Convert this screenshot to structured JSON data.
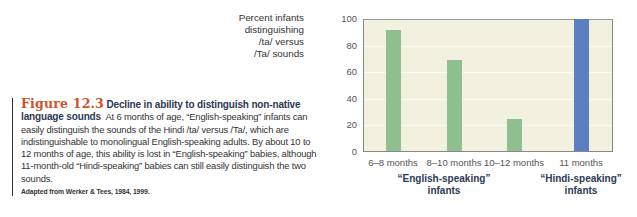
{
  "caption": {
    "figure_number": "Figure 12.3",
    "title": "Decline in ability to distinguish non-native language sounds",
    "body": "At 6 months of age, “English-speaking” infants can easily distinguish the sounds of the Hindi /ta/ versus /Ta/, which are indistinguishable to monolingual English-speaking adults. By about 10 to 12 months of age, this ability is lost in “English-speaking” babies, although 11-month-old “Hindi-speaking” babies can still easily distinguish the two sounds.",
    "source": "Adapted from Werker & Tees, 1984, 1999."
  },
  "chart_data": {
    "type": "bar",
    "title": "",
    "ylabel": "Percent infants distinguishing /ta/ versus /Ta/ sounds",
    "ylabel_lines": [
      "Percent infants",
      "distinguishing",
      "/ta/ versus",
      "/Ta/ sounds"
    ],
    "xlabel": "",
    "ylim": [
      0,
      100
    ],
    "yticks": [
      0,
      20,
      40,
      60,
      80,
      100
    ],
    "grid": true,
    "categories": [
      "6–8 months",
      "8–10 months",
      "10–12 months",
      "11 months"
    ],
    "values": [
      92,
      69,
      24,
      100
    ],
    "bar_colors": [
      "#8fbf8f",
      "#8fbf8f",
      "#8fbf8f",
      "#5b7fc0"
    ],
    "groups": [
      {
        "label": "“English-speaking” infants",
        "lines": [
          "“English-speaking”",
          "infants"
        ],
        "categories": [
          "6–8 months",
          "8–10 months",
          "10–12 months"
        ]
      },
      {
        "label": "“Hindi-speaking” infants",
        "lines": [
          "“Hindi-speaking”",
          "infants"
        ],
        "categories": [
          "11 months"
        ]
      }
    ],
    "colors": {
      "plot_bg": "#f2f1df",
      "english": "#8fbf8f",
      "hindi": "#5b7fc0"
    }
  }
}
